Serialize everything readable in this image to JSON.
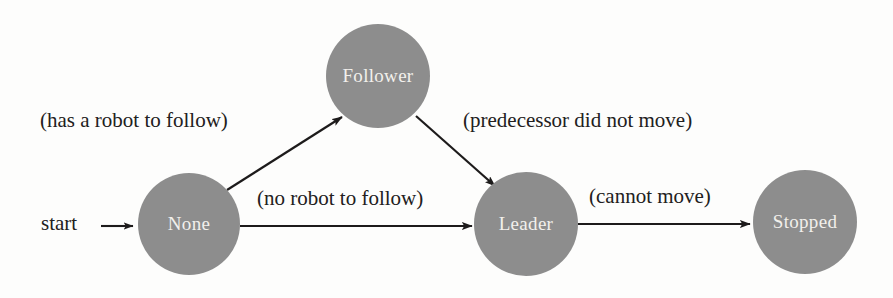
{
  "diagram": {
    "type": "state-machine",
    "colors": {
      "node_fill": "#8d8d8d",
      "node_text": "#f2f0ec",
      "edge": "#1d1b1b",
      "background": "#fdfdfc",
      "label_text": "#222020"
    },
    "start_marker": {
      "label": "start"
    },
    "nodes": [
      {
        "id": "none",
        "label": "None",
        "cx": 189,
        "cy": 224,
        "r": 51
      },
      {
        "id": "follower",
        "label": "Follower",
        "cx": 378,
        "cy": 76,
        "r": 52
      },
      {
        "id": "leader",
        "label": "Leader",
        "cx": 526,
        "cy": 224,
        "r": 52
      },
      {
        "id": "stopped",
        "label": "Stopped",
        "cx": 805,
        "cy": 222,
        "r": 52
      }
    ],
    "edges": [
      {
        "id": "none-to-follower",
        "from": "None",
        "to": "Follower",
        "label": "(has a robot to follow)",
        "label_x": 40,
        "label_y": 108
      },
      {
        "id": "follower-to-leader",
        "from": "Follower",
        "to": "Leader",
        "label": "(predecessor did not move)",
        "label_x": 463,
        "label_y": 108
      },
      {
        "id": "none-to-leader",
        "from": "None",
        "to": "Leader",
        "label": "(no robot to follow)",
        "label_x": 257,
        "label_y": 186
      },
      {
        "id": "leader-to-stopped",
        "from": "Leader",
        "to": "Stopped",
        "label": "(cannot move)",
        "label_x": 589,
        "label_y": 184
      }
    ]
  }
}
